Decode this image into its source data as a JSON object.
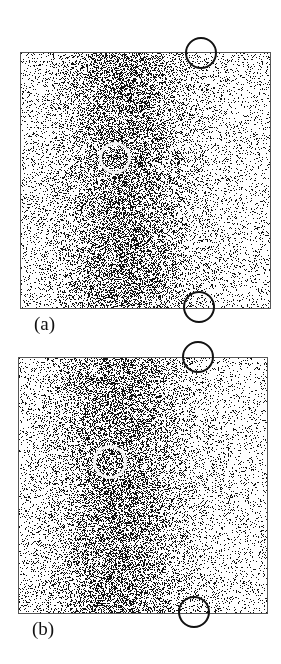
{
  "figure": {
    "panels": [
      {
        "id": "a",
        "label": "(a)",
        "box": {
          "x": 20,
          "y": 52,
          "w": 249,
          "h": 255
        },
        "label_pos": {
          "x": 34,
          "y": 313
        },
        "density_center_x": 0.42,
        "seed": 11,
        "white_circle": {
          "cx": 115,
          "cy": 158,
          "r": 16
        },
        "black_circles": [
          {
            "cx": 201,
            "cy": 53,
            "r": 16
          },
          {
            "cx": 199,
            "cy": 307,
            "r": 16
          }
        ]
      },
      {
        "id": "b",
        "label": "(b)",
        "box": {
          "x": 18,
          "y": 357,
          "w": 248,
          "h": 255
        },
        "label_pos": {
          "x": 32,
          "y": 618
        },
        "density_center_x": 0.4,
        "seed": 29,
        "white_circle": {
          "cx": 110,
          "cy": 462,
          "r": 17
        },
        "black_circles": [
          {
            "cx": 198,
            "cy": 357,
            "r": 16
          },
          {
            "cx": 194,
            "cy": 612,
            "r": 16
          }
        ]
      }
    ],
    "colors": {
      "dots": "#111111",
      "frame": "#555555",
      "background": "#ffffff"
    }
  }
}
